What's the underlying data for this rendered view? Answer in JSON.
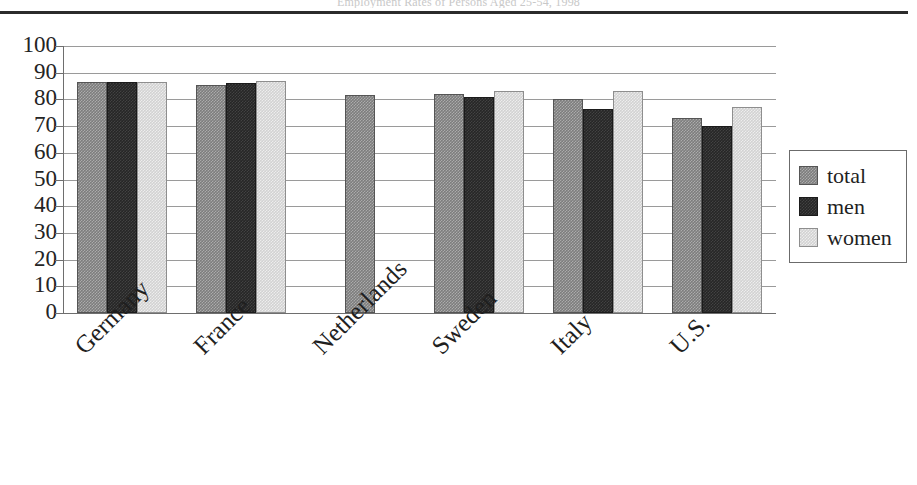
{
  "figure": {
    "title_cropped": "Employment Rates of Persons Aged 25-54, 1998"
  },
  "legend": {
    "position": "right",
    "items": [
      {
        "label": "total",
        "color": "#7d7d7d",
        "icon": "square-swatch-icon"
      },
      {
        "label": "men",
        "color": "#262626",
        "icon": "square-swatch-icon"
      },
      {
        "label": "women",
        "color": "#d2d2d2",
        "icon": "square-swatch-icon"
      }
    ]
  },
  "chart_data": {
    "type": "bar",
    "title": "Employment Rates of Persons Aged 25-54, 1998",
    "xlabel": "",
    "ylabel": "",
    "ylim": [
      0,
      100
    ],
    "yticks": [
      0,
      10,
      20,
      30,
      40,
      50,
      60,
      70,
      80,
      90,
      100
    ],
    "ytick_labels": [
      "0",
      "10",
      "20",
      "30",
      "40",
      "50",
      "60",
      "70",
      "80",
      "90",
      "100"
    ],
    "grid": true,
    "grid_axis": "y",
    "legend_position": "right",
    "categories": [
      "Germany",
      "France",
      "Netherlands",
      "Sweden",
      "Italy",
      "U.S."
    ],
    "series": [
      {
        "name": "total",
        "color": "#7d7d7d",
        "values": [
          86.5,
          85.5,
          81.5,
          82.0,
          80.0,
          73.0
        ]
      },
      {
        "name": "men",
        "color": "#262626",
        "values": [
          86.5,
          86.0,
          null,
          81.0,
          76.5,
          70.0
        ]
      },
      {
        "name": "women",
        "color": "#d2d2d2",
        "values": [
          86.5,
          87.0,
          null,
          83.0,
          83.0,
          77.0
        ]
      }
    ]
  }
}
